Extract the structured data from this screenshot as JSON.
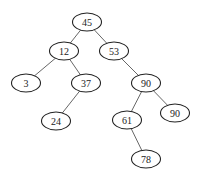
{
  "diagram": {
    "type": "binary-tree",
    "nodes": [
      {
        "id": "n45",
        "label": "45",
        "x": 87,
        "y": 22
      },
      {
        "id": "n12",
        "label": "12",
        "x": 64,
        "y": 51
      },
      {
        "id": "n53",
        "label": "53",
        "x": 114,
        "y": 51
      },
      {
        "id": "n3",
        "label": "3",
        "x": 26,
        "y": 83
      },
      {
        "id": "n37",
        "label": "37",
        "x": 86,
        "y": 83
      },
      {
        "id": "n90a",
        "label": "90",
        "x": 146,
        "y": 83
      },
      {
        "id": "n24",
        "label": "24",
        "x": 56,
        "y": 121
      },
      {
        "id": "n61",
        "label": "61",
        "x": 127,
        "y": 120
      },
      {
        "id": "n90b",
        "label": "90",
        "x": 175,
        "y": 113
      },
      {
        "id": "n78",
        "label": "78",
        "x": 146,
        "y": 159
      }
    ],
    "edges": [
      {
        "from": "n45",
        "to": "n12"
      },
      {
        "from": "n45",
        "to": "n53"
      },
      {
        "from": "n12",
        "to": "n3"
      },
      {
        "from": "n12",
        "to": "n37"
      },
      {
        "from": "n53",
        "to": "n90a"
      },
      {
        "from": "n37",
        "to": "n24"
      },
      {
        "from": "n90a",
        "to": "n61"
      },
      {
        "from": "n90a",
        "to": "n90b"
      },
      {
        "from": "n61",
        "to": "n78"
      }
    ]
  }
}
